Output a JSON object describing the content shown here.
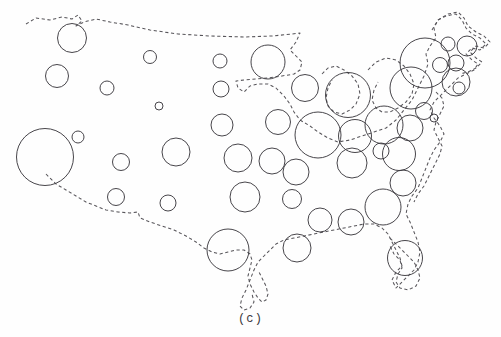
{
  "figure": {
    "caption": "(c)",
    "background_color": "#fefefe",
    "outline_color": "#57555a",
    "symbol_color": "#3d3b40"
  },
  "chart_data": {
    "type": "scatter",
    "subtitle": "(c)",
    "xlabel": "",
    "ylabel": "",
    "grid": false,
    "legend": false,
    "projection": "contiguous-united-states",
    "symbol": "open-circle",
    "encoding": "circle radius proportional to value",
    "xlim": [
      0,
      501
    ],
    "ylim": [
      0,
      337
    ],
    "annotations": [
      "(c)"
    ],
    "points": [
      {
        "label": "WA",
        "x": 72,
        "y": 38,
        "r": 14.5
      },
      {
        "label": "OR",
        "x": 57,
        "y": 76,
        "r": 11.5
      },
      {
        "label": "CA",
        "x": 45,
        "y": 157,
        "r": 28.5
      },
      {
        "label": "NV",
        "x": 78,
        "y": 137,
        "r": 6.0
      },
      {
        "label": "ID",
        "x": 107,
        "y": 88,
        "r": 7.0
      },
      {
        "label": "MT",
        "x": 150,
        "y": 57,
        "r": 6.5
      },
      {
        "label": "WY",
        "x": 159,
        "y": 106,
        "r": 4.0
      },
      {
        "label": "UT",
        "x": 116,
        "y": 197,
        "r": 8.5
      },
      {
        "label": "AZ",
        "x": 121,
        "y": 162,
        "r": 8.5
      },
      {
        "label": "CO",
        "x": 176,
        "y": 152,
        "r": 14.0
      },
      {
        "label": "NM",
        "x": 168,
        "y": 203,
        "r": 8.0
      },
      {
        "label": "ND",
        "x": 220,
        "y": 61,
        "r": 7.0
      },
      {
        "label": "SD",
        "x": 221,
        "y": 89,
        "r": 8.0
      },
      {
        "label": "NE",
        "x": 222,
        "y": 125,
        "r": 11.0
      },
      {
        "label": "KS",
        "x": 238,
        "y": 158,
        "r": 14.0
      },
      {
        "label": "OK",
        "x": 245,
        "y": 197,
        "r": 15.0
      },
      {
        "label": "TX",
        "x": 228,
        "y": 250,
        "r": 21.0
      },
      {
        "label": "MN",
        "x": 268,
        "y": 62,
        "r": 17.0
      },
      {
        "label": "IA",
        "x": 278,
        "y": 122,
        "r": 12.5
      },
      {
        "label": "MO",
        "x": 272,
        "y": 161,
        "r": 13.0
      },
      {
        "label": "AR",
        "x": 292,
        "y": 199,
        "r": 9.5
      },
      {
        "label": "LA",
        "x": 297,
        "y": 248,
        "r": 14.0
      },
      {
        "label": "MS",
        "x": 320,
        "y": 220,
        "r": 12.0
      },
      {
        "label": "AL",
        "x": 351,
        "y": 222,
        "r": 13.0
      },
      {
        "label": "TN",
        "x": 296,
        "y": 172,
        "r": 13.0
      },
      {
        "label": "WI",
        "x": 305,
        "y": 88,
        "r": 13.5
      },
      {
        "label": "IL",
        "x": 318,
        "y": 135,
        "r": 23.0
      },
      {
        "label": "MI",
        "x": 348,
        "y": 95,
        "r": 22.5
      },
      {
        "label": "IN",
        "x": 355,
        "y": 136,
        "r": 16.5
      },
      {
        "label": "OH",
        "x": 384,
        "y": 125,
        "r": 19.0
      },
      {
        "label": "KY",
        "x": 352,
        "y": 163,
        "r": 15.0
      },
      {
        "label": "GA",
        "x": 383,
        "y": 207,
        "r": 18.0
      },
      {
        "label": "SC",
        "x": 403,
        "y": 183,
        "r": 13.0
      },
      {
        "label": "NC",
        "x": 399,
        "y": 154,
        "r": 16.5
      },
      {
        "label": "VA",
        "x": 410,
        "y": 128,
        "r": 13.0
      },
      {
        "label": "WV",
        "x": 381,
        "y": 151,
        "r": 8.0
      },
      {
        "label": "PA",
        "x": 411,
        "y": 88,
        "r": 21.0
      },
      {
        "label": "NY",
        "x": 425,
        "y": 63,
        "r": 25.0
      },
      {
        "label": "MD",
        "x": 424,
        "y": 111,
        "r": 8.5
      },
      {
        "label": "DE",
        "x": 434,
        "y": 118,
        "r": 4.0
      },
      {
        "label": "NJ",
        "x": 440,
        "y": 65,
        "r": 7.5
      },
      {
        "label": "CT",
        "x": 456,
        "y": 63,
        "r": 8.0
      },
      {
        "label": "MA",
        "x": 456,
        "y": 82,
        "r": 14.0
      },
      {
        "label": "RI",
        "x": 459,
        "y": 88,
        "r": 6.0
      },
      {
        "label": "NH-VT",
        "x": 448,
        "y": 44,
        "r": 7.0
      },
      {
        "label": "ME",
        "x": 467,
        "y": 46,
        "r": 10.0
      },
      {
        "label": "FL",
        "x": 405,
        "y": 258,
        "r": 17.5
      }
    ]
  }
}
